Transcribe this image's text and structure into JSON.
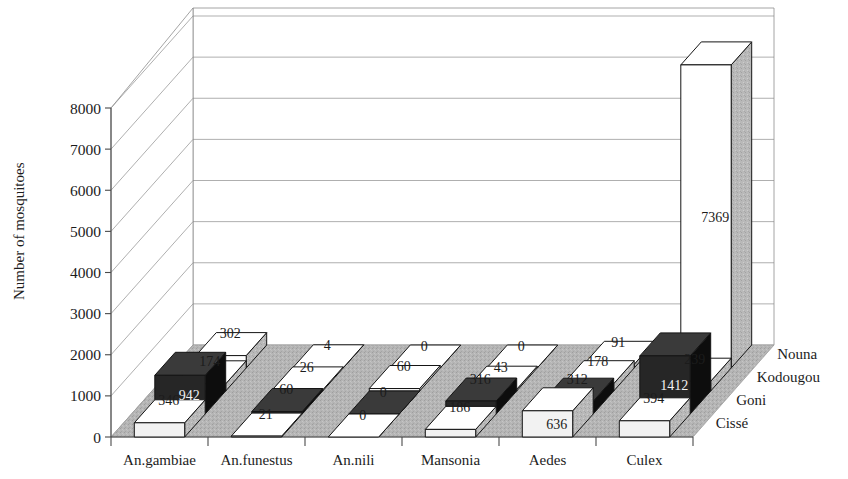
{
  "chart_data": {
    "type": "bar",
    "title": "",
    "xlabel": "",
    "ylabel": "Number of mosquitoes",
    "ylim": [
      0,
      8000
    ],
    "ytick_step": 1000,
    "yticks": [
      "0",
      "1000",
      "2000",
      "3000",
      "4000",
      "5000",
      "6000",
      "7000",
      "8000"
    ],
    "grid": true,
    "projection": "3d",
    "legend_position": "depth-axis-right",
    "categories": [
      "An.gambiae",
      "An.funestus",
      "An.nili",
      "Mansonia",
      "Aedes",
      "Culex"
    ],
    "series": [
      {
        "name": "Cissé",
        "color": "#f2f2f2",
        "values": [
          346,
          21,
          0,
          186,
          636,
          394
        ]
      },
      {
        "name": "Goni",
        "color": "#1a1a1a",
        "values": [
          942,
          60,
          0,
          316,
          312,
          1412
        ]
      },
      {
        "name": "Kodougou",
        "color": "#f2f2f2",
        "values": [
          174,
          26,
          60,
          43,
          178,
          239
        ]
      },
      {
        "name": "Nouna",
        "color": "#ffffff",
        "values": [
          302,
          4,
          0,
          0,
          91,
          7369
        ]
      }
    ]
  },
  "axis": {
    "y_title": "Number of mosquitoes"
  },
  "colors": {
    "floor": "#b3b3b3",
    "wall": "#ffffff",
    "grid": "#8d8d8d",
    "dark_bar": "#1a1a1a",
    "light_bar": "#f2f2f2",
    "side_shade": "#9a9a9a",
    "text": "#1c1c1c"
  }
}
